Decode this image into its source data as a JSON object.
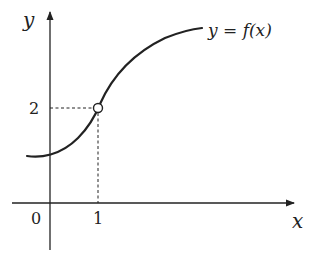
{
  "diagram": {
    "axes": {
      "x_label": "x",
      "y_label": "y"
    },
    "ticks": {
      "origin": "0",
      "x_tick": "1",
      "y_tick": "2"
    },
    "curve_label": "y = f(x)",
    "point": {
      "x": 1,
      "y": 2,
      "style": "open-circle"
    },
    "colors": {
      "stroke": "#222222",
      "background": "#ffffff"
    }
  }
}
